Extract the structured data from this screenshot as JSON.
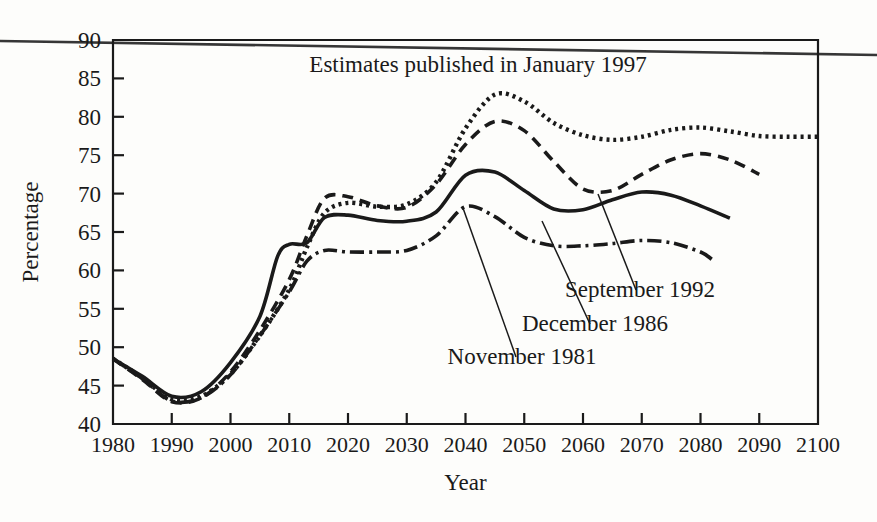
{
  "figure": {
    "background_color": "#fdfdfb",
    "ink_color": "#1a1a1a",
    "page_rule_note": "horizontal scan rule across top of page"
  },
  "chart_data": {
    "type": "line",
    "title": "",
    "subtitle": "",
    "xlabel": "Year",
    "ylabel": "Percentage",
    "xlim": [
      1980,
      2100
    ],
    "ylim": [
      40,
      90
    ],
    "xticks": [
      1980,
      1990,
      2000,
      2010,
      2020,
      2030,
      2040,
      2050,
      2060,
      2070,
      2080,
      2090,
      2100
    ],
    "yticks": [
      40,
      45,
      50,
      55,
      60,
      65,
      70,
      75,
      80,
      85,
      90
    ],
    "grid": false,
    "legend_position": "inline-annotations",
    "annotations": [
      {
        "name": "january-1997-annotation",
        "text": "Estimates published in January 1997",
        "x_px": 478,
        "y_px": 72,
        "leader": false
      },
      {
        "name": "september-1992-annotation",
        "text": "September 1992",
        "x_px": 640,
        "y_px": 297,
        "leader": true,
        "leader_from_px": [
          598,
          194
        ],
        "leader_to_px": [
          636,
          290
        ]
      },
      {
        "name": "december-1986-annotation",
        "text": "December 1986",
        "x_px": 595,
        "y_px": 331,
        "leader": true,
        "leader_from_px": [
          542,
          221
        ],
        "leader_to_px": [
          590,
          324
        ]
      },
      {
        "name": "november-1981-annotation",
        "text": "November 1981",
        "x_px": 522,
        "y_px": 364,
        "leader": true,
        "leader_from_px": [
          463,
          208
        ],
        "leader_to_px": [
          516,
          357
        ]
      }
    ],
    "x": [
      1980,
      1985,
      1990,
      1995,
      2000,
      2005,
      2010,
      2012,
      2015,
      2020,
      2025,
      2030,
      2035,
      2040,
      2045,
      2050,
      2055,
      2060,
      2065,
      2070,
      2075,
      2080,
      2085,
      2090,
      2095,
      2100
    ],
    "series": [
      {
        "name": "January 1997",
        "label": "Estimates published in January 1997",
        "style": "dotted",
        "dash_pattern": "3,4",
        "x": [
          1980,
          1985,
          1990,
          1995,
          2000,
          2005,
          2010,
          2013,
          2016,
          2020,
          2025,
          2030,
          2035,
          2040,
          2045,
          2050,
          2055,
          2060,
          2065,
          2070,
          2075,
          2080,
          2085,
          2090,
          2095,
          2100
        ],
        "values": [
          48.5,
          46.0,
          43.2,
          43.6,
          46.5,
          51.5,
          57.5,
          63.0,
          67.5,
          68.8,
          68.3,
          68.6,
          71.5,
          78.5,
          82.9,
          82.0,
          79.2,
          77.6,
          77.0,
          77.4,
          78.3,
          78.6,
          78.1,
          77.5,
          77.4,
          77.4
        ]
      },
      {
        "name": "September 1992",
        "label": "September 1992",
        "style": "dashed",
        "dash_pattern": "11,7",
        "x": [
          1980,
          1985,
          1990,
          1995,
          2000,
          2005,
          2010,
          2013,
          2016,
          2020,
          2025,
          2030,
          2035,
          2040,
          2045,
          2050,
          2055,
          2060,
          2065,
          2070,
          2075,
          2080,
          2085,
          2090
        ],
        "values": [
          48.5,
          45.8,
          42.9,
          43.4,
          46.8,
          52.2,
          58.8,
          64.5,
          69.4,
          69.6,
          68.4,
          68.2,
          71.2,
          76.4,
          79.4,
          78.2,
          74.2,
          70.6,
          70.4,
          72.5,
          74.4,
          75.2,
          74.4,
          72.5
        ]
      },
      {
        "name": "December 1986",
        "label": "December 1986",
        "style": "solid",
        "dash_pattern": "",
        "x": [
          1980,
          1985,
          1990,
          1995,
          2000,
          2005,
          2008,
          2010,
          2013,
          2016,
          2020,
          2025,
          2030,
          2035,
          2040,
          2045,
          2050,
          2055,
          2060,
          2065,
          2070,
          2075,
          2080,
          2085
        ],
        "values": [
          48.5,
          46.2,
          43.6,
          44.2,
          48.0,
          54.0,
          61.8,
          63.4,
          63.6,
          66.9,
          67.2,
          66.5,
          66.4,
          67.6,
          72.4,
          72.8,
          70.4,
          68.0,
          67.9,
          69.2,
          70.2,
          69.8,
          68.4,
          66.8
        ]
      },
      {
        "name": "November 1981",
        "label": "November 1981",
        "style": "dashdot",
        "dash_pattern": "14,5,3,5",
        "x": [
          1980,
          1985,
          1990,
          1995,
          2000,
          2005,
          2010,
          2013,
          2016,
          2020,
          2025,
          2030,
          2035,
          2040,
          2045,
          2050,
          2055,
          2060,
          2065,
          2070,
          2075,
          2080,
          2082
        ],
        "values": [
          48.5,
          45.9,
          43.0,
          43.4,
          46.4,
          51.5,
          57.2,
          61.2,
          62.6,
          62.4,
          62.4,
          62.6,
          64.5,
          68.3,
          67.0,
          64.3,
          63.2,
          63.2,
          63.5,
          63.9,
          63.6,
          62.4,
          61.4
        ]
      }
    ]
  }
}
